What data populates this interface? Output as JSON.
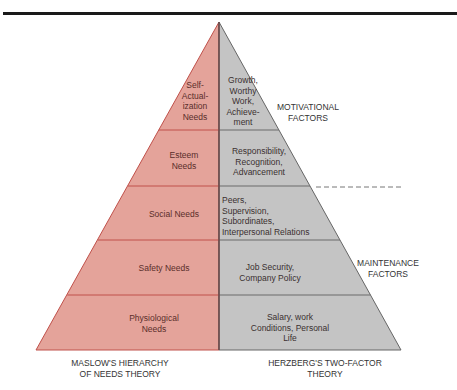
{
  "title_rule": true,
  "colors": {
    "maslow_fill": "#e4a39a",
    "herzberg_fill": "#c4c4c4",
    "left_divider": "#c0504a",
    "right_divider": "#6a6a6a",
    "center_line": "#6a4a4a",
    "outline_left": "#c0504a",
    "outline_right": "#666666"
  },
  "maslow": {
    "title": "MASLOW'S HIERARCHY\nOF NEEDS THEORY",
    "levels": [
      {
        "label": "Self-\nActual-\nization\nNeeds"
      },
      {
        "label": "Esteem\nNeeds"
      },
      {
        "label": "Social Needs"
      },
      {
        "label": "Safety Needs"
      },
      {
        "label": "Physiological\nNeeds"
      }
    ]
  },
  "herzberg": {
    "title": "HERZBERG'S TWO-FACTOR\nTHEORY",
    "levels": [
      {
        "label": "Growth,\nWorthy\nWork,\nAchieve-\nment"
      },
      {
        "label": "Responsibility,\nRecognition,\nAdvancement"
      },
      {
        "label": "Peers,\nSupervision,\nSubordinates,\nInterpersonal Relations"
      },
      {
        "label": "Job Security,\nCompany Policy"
      },
      {
        "label": "Salary, work\nConditions, Personal\nLife"
      }
    ],
    "groups": [
      {
        "label": "MOTIVATIONAL\nFACTORS"
      },
      {
        "label": "MAINTENANCE\nFACTORS"
      }
    ]
  }
}
